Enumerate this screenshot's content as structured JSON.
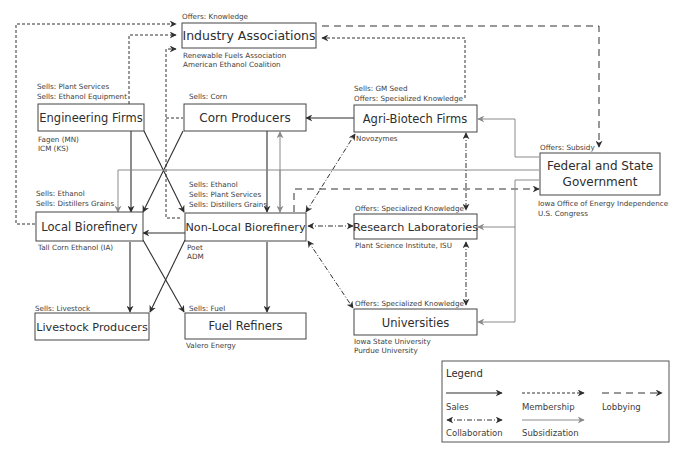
{
  "colors": {
    "line_dark": "#2f2f2f",
    "line_gray": "#8a8a8a",
    "box_border": "#444444",
    "text": "#333333"
  },
  "nodes": {
    "industry": {
      "label": "Industry Associations",
      "note_above": [
        "Offers: Knowledge"
      ],
      "note_below": [
        "Renewable Fuels Association",
        "American Ethanol Coalition"
      ]
    },
    "engineering": {
      "label": "Engineering Firms",
      "note_above": [
        "Sells: Plant Services",
        "Sells: Ethanol Equipment"
      ],
      "note_below": [
        "Fagen (MN)",
        "ICM (KS)"
      ]
    },
    "corn": {
      "label": "Corn Producers",
      "note_above": [
        "Sells: Corn"
      ],
      "note_below": []
    },
    "agribiotech": {
      "label": "Agri-Biotech Firms",
      "note_above": [
        "Sells: GM Seed",
        "Offers: Specialized Knowledge"
      ],
      "note_below": [
        "Novozymes"
      ]
    },
    "government": {
      "label_lines": [
        "Federal and State",
        "Government"
      ],
      "note_above": [
        "Offers: Subsidy"
      ],
      "note_below": [
        "Iowa Office of Energy Independence",
        "U.S. Congress"
      ]
    },
    "local": {
      "label": "Local Biorefinery",
      "note_above": [
        "Sells: Ethanol",
        "Sells: Distillers Grains"
      ],
      "note_below": [
        "Tall Corn Ethanol (IA)"
      ]
    },
    "nonlocal": {
      "label": "Non-Local Biorefinery",
      "note_above": [
        "Sells: Ethanol",
        "Sells: Plant Services",
        "Sells: Distillers Grains"
      ],
      "note_below": [
        "Poet",
        "ADM"
      ]
    },
    "research": {
      "label": "Research Laboratories",
      "note_above": [
        "Offers: Specialized Knowledge"
      ],
      "note_below": [
        "Plant Science Institute, ISU"
      ]
    },
    "livestock": {
      "label": "Livestock Producers",
      "note_above": [
        "Sells: Livestock"
      ],
      "note_below": []
    },
    "fuel": {
      "label": "Fuel Refiners",
      "note_above": [
        "Sells: Fuel"
      ],
      "note_below": [
        "Valero Energy"
      ]
    },
    "universities": {
      "label": "Universities",
      "note_above": [
        "Offers: Specialized Knowledge"
      ],
      "note_below": [
        "Iowa State University",
        "Purdue University"
      ]
    }
  },
  "legend": {
    "title": "Legend",
    "items": [
      {
        "label": "Sales",
        "style": "solid-dark"
      },
      {
        "label": "Membership",
        "style": "short-dash"
      },
      {
        "label": "Lobbying",
        "style": "long-dash"
      },
      {
        "label": "Collaboration",
        "style": "dash-dot-bidirectional"
      },
      {
        "label": "Subsidization",
        "style": "solid-gray"
      }
    ]
  }
}
